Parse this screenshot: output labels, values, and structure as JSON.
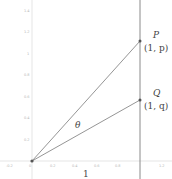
{
  "diagram": {
    "type": "geometry",
    "axes": {
      "x_ticks": [
        "-0.2",
        "0",
        "0.2",
        "0.4",
        "0.6",
        "0.8",
        "1.2"
      ],
      "y_ticks": [
        "0.2",
        "0.4",
        "0.6",
        "0.8",
        "1",
        "1.2",
        "1.4"
      ]
    },
    "points": {
      "origin": {
        "x": 0,
        "y": 0
      },
      "P": {
        "name": "P",
        "coord_label": "(1, p)",
        "x": 1,
        "y": 1.11
      },
      "Q": {
        "name": "Q",
        "coord_label": "(1, q)",
        "x": 1,
        "y": 0.56
      }
    },
    "labels": {
      "angle": "θ",
      "unit_length": "1"
    },
    "colors": {
      "axis": "#cccccc",
      "vertical_line": "#888888",
      "ray": "#777777",
      "point": "#555555",
      "text": "#444444"
    }
  }
}
